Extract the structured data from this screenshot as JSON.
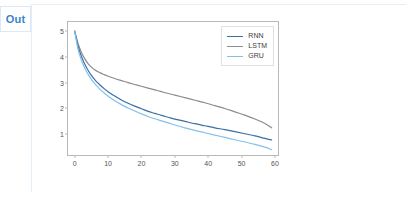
{
  "prompt": {
    "label": "Out"
  },
  "chart_data": {
    "type": "line",
    "title": "",
    "xlabel": "",
    "ylabel": "",
    "xlim": [
      -2.0,
      61.5
    ],
    "ylim": [
      0.12,
      5.35
    ],
    "xticks": [
      0,
      10,
      20,
      30,
      40,
      50,
      60
    ],
    "yticks": [
      1,
      2,
      3,
      4,
      5
    ],
    "grid": false,
    "legend_position": "upper right",
    "x": [
      0,
      1,
      2,
      3,
      4,
      5,
      6,
      7,
      8,
      9,
      10,
      12,
      14,
      16,
      18,
      20,
      22,
      24,
      26,
      28,
      30,
      33,
      36,
      39,
      42,
      45,
      48,
      51,
      54,
      57,
      59
    ],
    "series": [
      {
        "name": "RNN",
        "color": "#3a6fa5",
        "values": [
          5.0,
          4.42,
          4.02,
          3.72,
          3.48,
          3.28,
          3.12,
          2.98,
          2.86,
          2.75,
          2.65,
          2.48,
          2.33,
          2.2,
          2.09,
          1.99,
          1.89,
          1.81,
          1.73,
          1.66,
          1.59,
          1.5,
          1.41,
          1.33,
          1.25,
          1.18,
          1.1,
          1.02,
          0.94,
          0.84,
          0.78
        ]
      },
      {
        "name": "LSTM",
        "color": "#8c8c8c",
        "values": [
          5.0,
          4.52,
          4.18,
          3.93,
          3.74,
          3.6,
          3.5,
          3.42,
          3.36,
          3.3,
          3.25,
          3.16,
          3.08,
          3.0,
          2.93,
          2.86,
          2.79,
          2.72,
          2.65,
          2.58,
          2.52,
          2.42,
          2.32,
          2.22,
          2.11,
          2.0,
          1.87,
          1.74,
          1.59,
          1.42,
          1.25
        ]
      },
      {
        "name": "GRU",
        "color": "#84c0e8",
        "values": [
          5.0,
          4.3,
          3.88,
          3.57,
          3.33,
          3.13,
          2.96,
          2.82,
          2.69,
          2.58,
          2.48,
          2.3,
          2.15,
          2.02,
          1.9,
          1.79,
          1.69,
          1.6,
          1.52,
          1.44,
          1.36,
          1.25,
          1.15,
          1.06,
          0.97,
          0.88,
          0.79,
          0.7,
          0.61,
          0.5,
          0.4
        ]
      }
    ]
  }
}
